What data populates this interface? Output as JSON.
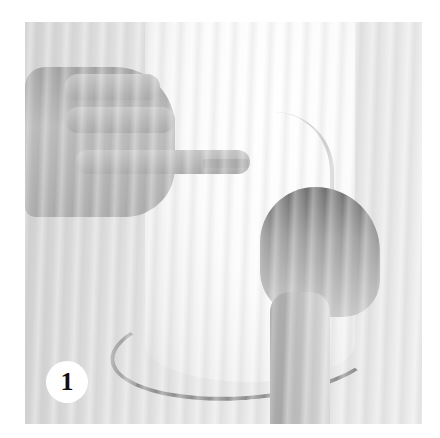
{
  "image": {
    "description": "Instructional craft photo: left hand holds ribbon end against a white cylindrical canister while right hand wraps the ribbon around it",
    "background_color": "#ffffff"
  },
  "step_badge": {
    "number": "1",
    "fill_color": "#ffffff",
    "text_color": "#111111"
  }
}
